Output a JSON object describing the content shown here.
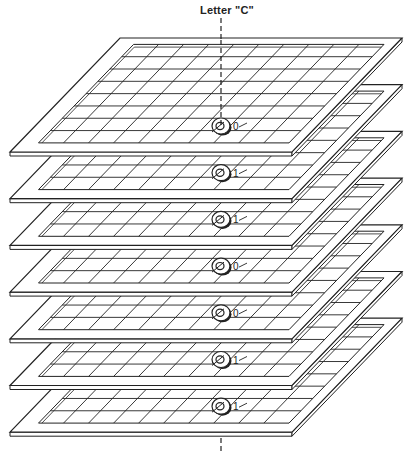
{
  "diagram": {
    "title": "Letter \"C\"",
    "colors": {
      "ink": "#222222",
      "paper": "#ffffff",
      "frame_fill": "#ffffff",
      "core_fill": "#ffffff"
    },
    "plane_count": 7,
    "grid": {
      "columns": 10,
      "rows": 8
    },
    "planes": [
      {
        "index": 1,
        "bit": "0"
      },
      {
        "index": 2,
        "bit": "1"
      },
      {
        "index": 3,
        "bit": "1"
      },
      {
        "index": 4,
        "bit": "0"
      },
      {
        "index": 5,
        "bit": "0"
      },
      {
        "index": 6,
        "bit": "1"
      },
      {
        "index": 7,
        "bit": "1"
      }
    ],
    "bits_top_to_bottom": [
      "0",
      "1",
      "1",
      "0",
      "0",
      "1",
      "1"
    ]
  }
}
